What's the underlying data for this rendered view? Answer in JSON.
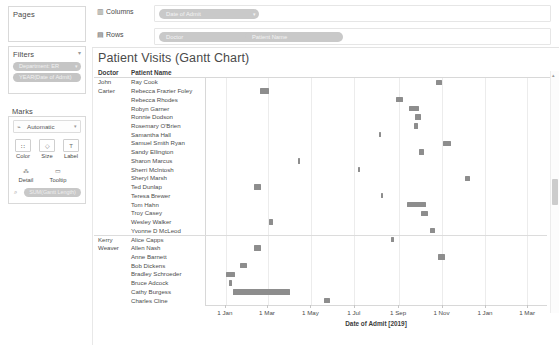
{
  "shelves": {
    "pages_label": "Pages",
    "columns_label": "Columns",
    "rows_label": "Rows",
    "columns_pill": "Date of Admit",
    "rows_pill_1": "Doctor",
    "rows_pill_2": "Patient Name"
  },
  "filters": {
    "title": "Filters",
    "items": [
      {
        "label": "Department: ER"
      },
      {
        "label": "YEAR(Date of Admit)"
      }
    ]
  },
  "marks": {
    "title": "Marks",
    "type": "Automatic",
    "buttons": [
      {
        "label": "Color",
        "icon": "color-icon"
      },
      {
        "label": "Size",
        "icon": "size-icon"
      },
      {
        "label": "Label",
        "icon": "label-icon"
      },
      {
        "label": "Detail",
        "icon": "detail-icon"
      },
      {
        "label": "Tooltip",
        "icon": "tooltip-icon"
      }
    ],
    "pill": "SUM(Gantt Length)"
  },
  "viz": {
    "title": "Patient Visits (Gantt Chart)",
    "col_doctor": "Doctor",
    "col_patient": "Patient Name"
  },
  "chart_data": {
    "type": "bar",
    "title": "Patient Visits (Gantt Chart)",
    "xlabel": "Date of Admit [2019]",
    "ylabel": "",
    "grid": true,
    "legend": null,
    "xtick_labels": [
      "1 Jan",
      "1 Mar",
      "1 May",
      "1 Jul",
      "1 Sep",
      "1 Nov",
      "1 Jan",
      "1 Mar"
    ],
    "xtick_days": [
      0,
      59,
      120,
      181,
      243,
      304,
      365,
      424
    ],
    "xlim_days": [
      -28,
      452
    ],
    "groups": [
      {
        "doctor": "John Carter",
        "rows": [
          {
            "patient": "Ray Cook",
            "start_day": 296,
            "length_days": 8
          },
          {
            "patient": "Rebecca Frazier Foley",
            "start_day": 48,
            "length_days": 12
          },
          {
            "patient": "Rebecca Rhodes",
            "start_day": 240,
            "length_days": 9
          },
          {
            "patient": "Robyn Garner",
            "start_day": 258,
            "length_days": 14
          },
          {
            "patient": "Ronnie Dodson",
            "start_day": 266,
            "length_days": 8
          },
          {
            "patient": "Rosemary O'Brien",
            "start_day": 265,
            "length_days": 5
          },
          {
            "patient": "Samantha Hall",
            "start_day": 215,
            "length_days": 3
          },
          {
            "patient": "Samuel Smith Ryan",
            "start_day": 306,
            "length_days": 11
          },
          {
            "patient": "Sandy Ellington",
            "start_day": 272,
            "length_days": 7
          },
          {
            "patient": "Sharon Marcus",
            "start_day": 101,
            "length_days": 3
          },
          {
            "patient": "Sherri McIntosh",
            "start_day": 186,
            "length_days": 3
          },
          {
            "patient": "Sheryl Marsh",
            "start_day": 337,
            "length_days": 6
          },
          {
            "patient": "Ted Dunlap",
            "start_day": 40,
            "length_days": 10
          },
          {
            "patient": "Teresa Brewer",
            "start_day": 218,
            "length_days": 3
          },
          {
            "patient": "Tom Hahn",
            "start_day": 255,
            "length_days": 26
          },
          {
            "patient": "Troy Casey",
            "start_day": 275,
            "length_days": 10
          },
          {
            "patient": "Wesley Walker",
            "start_day": 60,
            "length_days": 6
          },
          {
            "patient": "Yvonne D McLeod",
            "start_day": 288,
            "length_days": 7
          }
        ]
      },
      {
        "doctor": "Kerry Weaver",
        "rows": [
          {
            "patient": "Alice Capps",
            "start_day": 232,
            "length_days": 4
          },
          {
            "patient": "Allen Nash",
            "start_day": 40,
            "length_days": 10
          },
          {
            "patient": "Anne Barnett",
            "start_day": 299,
            "length_days": 10
          },
          {
            "patient": "Bob Dickens",
            "start_day": 20,
            "length_days": 10
          },
          {
            "patient": "Bradley Schroeder",
            "start_day": 0,
            "length_days": 13
          },
          {
            "patient": "Bruce Adcock",
            "start_day": 4,
            "length_days": 5
          },
          {
            "patient": "Cathy Burgess",
            "start_day": 10,
            "length_days": 80
          },
          {
            "patient": "Charles Cline",
            "start_day": 138,
            "length_days": 9
          }
        ]
      }
    ]
  }
}
